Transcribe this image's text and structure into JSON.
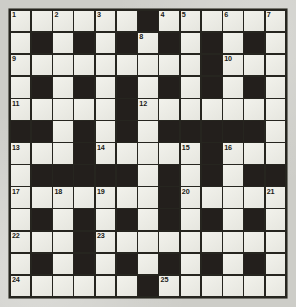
{
  "puzzle": {
    "kind": "crossword-grid",
    "title": "",
    "rows": 13,
    "columns": 13,
    "colors": {
      "page_background": "#cdcdc8",
      "grid_line": "#26251f",
      "white_cell": "#ecece6",
      "block_cell": "#231f1c",
      "number_text": "#1a1a16"
    },
    "grid": [
      [
        "white",
        "white",
        "white",
        "white",
        "white",
        "white",
        "block",
        "white",
        "white",
        "white",
        "white",
        "white",
        "white"
      ],
      [
        "white",
        "block",
        "white",
        "block",
        "white",
        "block",
        "white",
        "block",
        "white",
        "block",
        "white",
        "block",
        "white"
      ],
      [
        "white",
        "white",
        "white",
        "white",
        "white",
        "white",
        "white",
        "white",
        "white",
        "block",
        "white",
        "white",
        "white"
      ],
      [
        "white",
        "block",
        "white",
        "block",
        "white",
        "block",
        "white",
        "block",
        "white",
        "block",
        "white",
        "block",
        "white"
      ],
      [
        "white",
        "white",
        "white",
        "white",
        "white",
        "block",
        "white",
        "white",
        "white",
        "white",
        "white",
        "white",
        "white"
      ],
      [
        "block",
        "block",
        "white",
        "block",
        "white",
        "block",
        "white",
        "block",
        "block",
        "block",
        "block",
        "block",
        "white"
      ],
      [
        "white",
        "white",
        "white",
        "block",
        "white",
        "white",
        "white",
        "white",
        "white",
        "block",
        "white",
        "white",
        "white"
      ],
      [
        "white",
        "block",
        "block",
        "block",
        "block",
        "block",
        "white",
        "block",
        "white",
        "block",
        "white",
        "block",
        "block"
      ],
      [
        "white",
        "white",
        "white",
        "white",
        "white",
        "white",
        "white",
        "block",
        "white",
        "white",
        "white",
        "white",
        "white"
      ],
      [
        "white",
        "block",
        "white",
        "block",
        "white",
        "block",
        "white",
        "block",
        "white",
        "block",
        "white",
        "block",
        "white"
      ],
      [
        "white",
        "white",
        "white",
        "block",
        "white",
        "white",
        "white",
        "white",
        "white",
        "white",
        "white",
        "white",
        "white"
      ],
      [
        "white",
        "block",
        "white",
        "block",
        "white",
        "block",
        "white",
        "block",
        "white",
        "block",
        "white",
        "block",
        "white"
      ],
      [
        "white",
        "white",
        "white",
        "white",
        "white",
        "white",
        "block",
        "white",
        "white",
        "white",
        "white",
        "white",
        "white"
      ]
    ],
    "numbers": [
      {
        "label": "1",
        "row": 1,
        "col": 1
      },
      {
        "label": "2",
        "row": 1,
        "col": 3
      },
      {
        "label": "3",
        "row": 1,
        "col": 5
      },
      {
        "label": "4",
        "row": 1,
        "col": 8
      },
      {
        "label": "5",
        "row": 1,
        "col": 9
      },
      {
        "label": "6",
        "row": 1,
        "col": 11
      },
      {
        "label": "7",
        "row": 1,
        "col": 13
      },
      {
        "label": "8",
        "row": 2,
        "col": 7
      },
      {
        "label": "9",
        "row": 3,
        "col": 1
      },
      {
        "label": "10",
        "row": 3,
        "col": 11
      },
      {
        "label": "11",
        "row": 5,
        "col": 1
      },
      {
        "label": "12",
        "row": 5,
        "col": 7
      },
      {
        "label": "13",
        "row": 7,
        "col": 1
      },
      {
        "label": "14",
        "row": 7,
        "col": 5
      },
      {
        "label": "15",
        "row": 7,
        "col": 9
      },
      {
        "label": "16",
        "row": 7,
        "col": 11
      },
      {
        "label": "17",
        "row": 9,
        "col": 1
      },
      {
        "label": "18",
        "row": 9,
        "col": 3
      },
      {
        "label": "19",
        "row": 9,
        "col": 5
      },
      {
        "label": "20",
        "row": 9,
        "col": 9
      },
      {
        "label": "21",
        "row": 9,
        "col": 13
      },
      {
        "label": "22",
        "row": 11,
        "col": 1
      },
      {
        "label": "23",
        "row": 11,
        "col": 5
      },
      {
        "label": "24",
        "row": 13,
        "col": 1
      },
      {
        "label": "25",
        "row": 13,
        "col": 8
      }
    ],
    "letters": []
  }
}
